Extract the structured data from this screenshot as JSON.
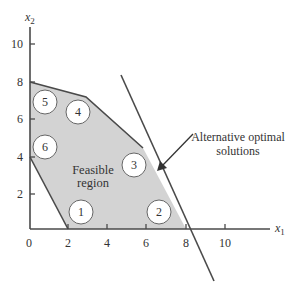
{
  "figure": {
    "type": "linear-programming-feasible-region",
    "axes": {
      "x_label": "x",
      "x_label_sub": "1",
      "y_label": "x",
      "y_label_sub": "2",
      "x_ticks": [
        "0",
        "2",
        "4",
        "6",
        "8",
        "10"
      ],
      "y_ticks": [
        "2",
        "4",
        "6",
        "8",
        "10"
      ]
    },
    "region": {
      "label_line1": "Feasible",
      "label_line2": "region",
      "fill_color": "#d3d3d3",
      "edge_color": "#4a4a4a",
      "vertices": [
        [
          0,
          8
        ],
        [
          3,
          7
        ],
        [
          6,
          4.5
        ],
        [
          8,
          0
        ],
        [
          2,
          0
        ],
        [
          0,
          4
        ]
      ]
    },
    "constraints": [
      {
        "id": "1",
        "label": "1"
      },
      {
        "id": "2",
        "label": "2"
      },
      {
        "id": "3",
        "label": "3"
      },
      {
        "id": "4",
        "label": "4"
      },
      {
        "id": "5",
        "label": "5"
      },
      {
        "id": "6",
        "label": "6"
      }
    ],
    "objective_line": {
      "note_line1": "Alternative optimal",
      "note_line2": "solutions"
    }
  }
}
